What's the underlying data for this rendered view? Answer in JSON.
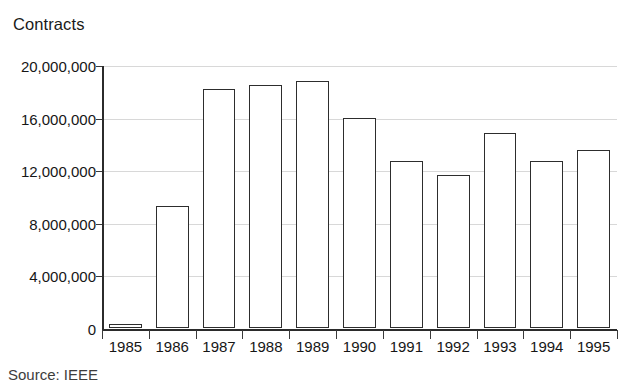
{
  "chart_data": {
    "type": "bar",
    "title": "Contracts",
    "xlabel": "",
    "ylabel": "",
    "categories": [
      "1985",
      "1986",
      "1987",
      "1988",
      "1989",
      "1990",
      "1991",
      "1992",
      "1993",
      "1994",
      "1995"
    ],
    "values": [
      300000,
      9300000,
      18200000,
      18500000,
      18800000,
      16000000,
      12700000,
      11600000,
      14800000,
      12700000,
      13500000
    ],
    "ylim": [
      0,
      20000000
    ],
    "ytick_values": [
      0,
      4000000,
      8000000,
      12000000,
      16000000,
      20000000
    ],
    "ytick_labels": [
      "0",
      "4,000,000",
      "8,000,000",
      "12,000,000",
      "16,000,000",
      "20,000,000"
    ],
    "grid": true,
    "legend": null,
    "bar_style": {
      "fill": "#ffffff",
      "edge": "#2d2d2d"
    },
    "axis_color": "#2b2b2b",
    "grid_color": "#d8d8d8",
    "text_color": "#161616"
  },
  "source_note": "Source: IEEE"
}
